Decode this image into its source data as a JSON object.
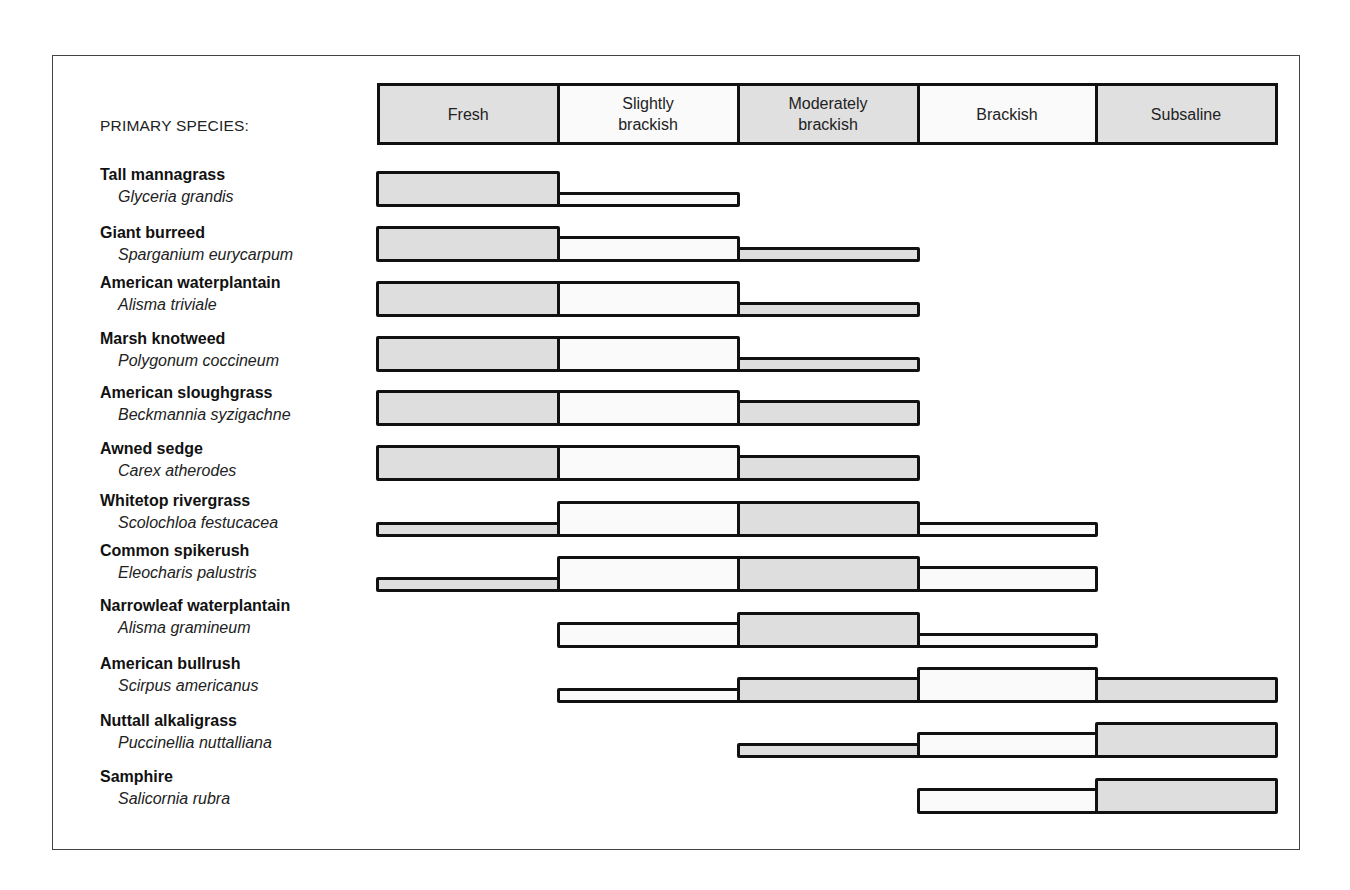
{
  "diagram": {
    "label": "PRIMARY SPECIES:",
    "shade_color": "#dedede",
    "light_color": "#fafafa",
    "salinity_zones": [
      {
        "label": "Fresh",
        "shade": true
      },
      {
        "label": "Slightly brackish",
        "shade": false
      },
      {
        "label": "Moderately brackish",
        "shade": true
      },
      {
        "label": "Brackish",
        "shade": false
      },
      {
        "label": "Subsaline",
        "shade": true
      }
    ],
    "species": [
      {
        "common": "Tall mannagrass",
        "latin": "Glyceria grandis",
        "tolerance": [
          "high",
          "low",
          null,
          null,
          null
        ]
      },
      {
        "common": "Giant burreed",
        "latin": "Sparganium eurycarpum",
        "tolerance": [
          "high",
          "medium",
          "low",
          null,
          null
        ]
      },
      {
        "common": "American waterplantain",
        "latin": "Alisma triviale",
        "tolerance": [
          "high",
          "high",
          "low",
          null,
          null
        ]
      },
      {
        "common": "Marsh knotweed",
        "latin": "Polygonum coccineum",
        "tolerance": [
          "high",
          "high",
          "low",
          null,
          null
        ]
      },
      {
        "common": "American sloughgrass",
        "latin": "Beckmannia syzigachne",
        "tolerance": [
          "high",
          "high",
          "medium",
          null,
          null
        ]
      },
      {
        "common": "Awned sedge",
        "latin": "Carex atherodes",
        "tolerance": [
          "high",
          "high",
          "medium",
          null,
          null
        ]
      },
      {
        "common": "Whitetop rivergrass",
        "latin": "Scolochloa festucacea",
        "tolerance": [
          "low",
          "high",
          "high",
          "low",
          null
        ]
      },
      {
        "common": "Common spikerush",
        "latin": "Eleocharis palustris",
        "tolerance": [
          "low",
          "high",
          "high",
          "medium",
          null
        ]
      },
      {
        "common": "Narrowleaf waterplantain",
        "latin": "Alisma gramineum",
        "tolerance": [
          null,
          "medium",
          "high",
          "low",
          null
        ]
      },
      {
        "common": "American bullrush",
        "latin": "Scirpus americanus",
        "tolerance": [
          null,
          "low",
          "medium",
          "high",
          "medium"
        ]
      },
      {
        "common": "Nuttall alkaligrass",
        "latin": "Puccinellia nuttalliana",
        "tolerance": [
          null,
          null,
          "low",
          "medium",
          "high"
        ]
      },
      {
        "common": "Samphire",
        "latin": "Salicornia rubra",
        "tolerance": [
          null,
          null,
          null,
          "medium",
          "high"
        ]
      }
    ]
  }
}
